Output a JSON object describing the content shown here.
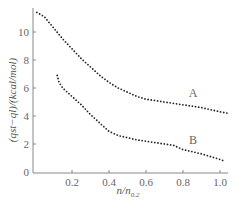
{
  "chart_data": {
    "type": "scatter",
    "title": "",
    "xlabel": "n/n0.2",
    "xlabel_main": "n/n",
    "xlabel_sub": "0.2",
    "ylabel": "(qst−ql)/(kcal/mol)",
    "xlim": [
      0,
      1.05
    ],
    "ylim": [
      0,
      12
    ],
    "x_ticks": [
      "0.2",
      "0.4",
      "0.6",
      "0.8",
      "1.0"
    ],
    "y_ticks": [
      "0",
      "2",
      "4",
      "6",
      "8",
      "10"
    ],
    "grid": false,
    "legend": "inline labels",
    "series": [
      {
        "name": "A",
        "points": [
          [
            0.01,
            11.4
          ],
          [
            0.05,
            11.1
          ],
          [
            0.1,
            10.3
          ],
          [
            0.15,
            9.5
          ],
          [
            0.2,
            8.8
          ],
          [
            0.25,
            8.1
          ],
          [
            0.3,
            7.5
          ],
          [
            0.35,
            6.9
          ],
          [
            0.4,
            6.4
          ],
          [
            0.45,
            6.0
          ],
          [
            0.5,
            5.7
          ],
          [
            0.55,
            5.4
          ],
          [
            0.6,
            5.2
          ],
          [
            0.7,
            5.0
          ],
          [
            0.8,
            4.8
          ],
          [
            0.9,
            4.6
          ],
          [
            1.0,
            4.3
          ],
          [
            1.04,
            4.2
          ]
        ]
      },
      {
        "name": "B",
        "points": [
          [
            0.12,
            6.9
          ],
          [
            0.13,
            6.4
          ],
          [
            0.15,
            6.0
          ],
          [
            0.2,
            5.4
          ],
          [
            0.25,
            4.8
          ],
          [
            0.3,
            4.1
          ],
          [
            0.35,
            3.5
          ],
          [
            0.4,
            2.9
          ],
          [
            0.45,
            2.6
          ],
          [
            0.5,
            2.45
          ],
          [
            0.55,
            2.3
          ],
          [
            0.6,
            2.2
          ],
          [
            0.7,
            2.0
          ],
          [
            0.75,
            1.9
          ],
          [
            0.8,
            1.6
          ],
          [
            0.9,
            1.3
          ],
          [
            1.0,
            0.9
          ],
          [
            1.02,
            0.8
          ]
        ]
      }
    ]
  }
}
